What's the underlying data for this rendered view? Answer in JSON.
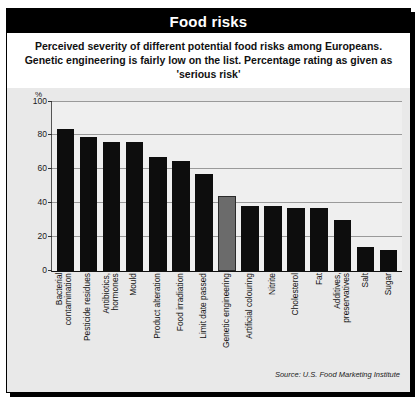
{
  "figure": {
    "title": "Food risks",
    "subtitle": "Perceived severity of different potential food risks among Europeans. Genetic engineering is fairly low on the list. Percentage rating as given as 'serious risk'",
    "source": "Source: U.S. Food Marketing Institute",
    "colors": {
      "title_bar_background": "#000000",
      "title_text": "#ffffff",
      "bar": "#0d0d0d",
      "highlight_bar": "#6b6b6b",
      "plot_background": "#efefef",
      "panel_background": "#e9e9e9",
      "gridline": "#9a9a9a"
    }
  },
  "chart_data": {
    "type": "bar",
    "title": "Food risks",
    "xlabel": "",
    "ylabel": "%",
    "ylim": [
      0,
      100
    ],
    "yticks": [
      0,
      20,
      40,
      60,
      80,
      100
    ],
    "grid": true,
    "legend": "none",
    "highlight_category": "Genetic engineering",
    "categories": [
      "Bacterial\ncontamination",
      "Pesticide residues",
      "Antibiotics,\nhormones",
      "Mould",
      "Product alteration",
      "Food irradiation",
      "Limit date passed",
      "Genetic engineering",
      "Artificial colouring",
      "Nitrite",
      "Cholesterol",
      "Fat",
      "Additives,\npreservatives",
      "Salt",
      "Sugar"
    ],
    "values": [
      84,
      79,
      76,
      76,
      67,
      65,
      57,
      44,
      38,
      38,
      37,
      37,
      30,
      14,
      12
    ]
  }
}
